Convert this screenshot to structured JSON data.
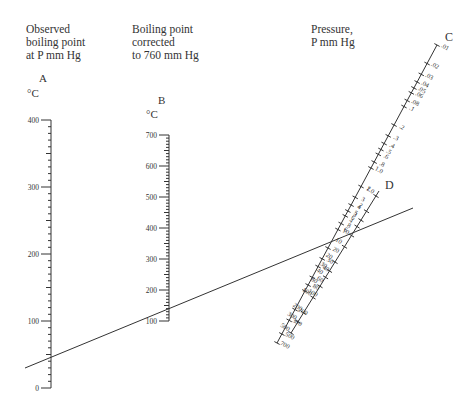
{
  "headers": {
    "observed": [
      "Observed",
      "boiling point",
      "at P mm Hg"
    ],
    "corrected": [
      "Boiling point",
      "corrected",
      "to 760 mm Hg"
    ],
    "pressure": [
      "Pressure,",
      "P mm Hg"
    ]
  },
  "scales": {
    "A": {
      "letter": "A",
      "unit": "°C",
      "ticks": [
        "400",
        "300",
        "200",
        "100",
        "0"
      ]
    },
    "B": {
      "letter": "B",
      "unit": "°C",
      "ticks": [
        "700",
        "600",
        "500",
        "400",
        "300",
        "200",
        "100"
      ]
    },
    "C": {
      "letter": "C",
      "ticks": [
        ".01",
        ".02",
        ".03",
        ".04",
        ".05",
        ".06",
        ".08",
        ".1",
        ".2",
        ".3",
        ".4",
        ".5",
        ".6",
        ".8",
        "1.0",
        "2",
        "3",
        "4",
        "5",
        "6",
        "8",
        "10",
        "20",
        "30",
        "40",
        "60",
        "80",
        "100",
        "200",
        "300",
        "500",
        "700"
      ]
    },
    "D": {
      "letter": "D",
      "ticks": [
        "1.0",
        "2",
        "3",
        "4",
        "6",
        "10",
        "20",
        "30",
        "40",
        "60",
        "100",
        "200",
        "300",
        "500"
      ]
    }
  },
  "colors": {
    "ink": "#333333",
    "background": "#ffffff"
  },
  "chart_data": {
    "type": "nomograph",
    "axes": [
      {
        "id": "A",
        "label": "Observed boiling point at P mm Hg",
        "unit": "°C",
        "range": [
          0,
          400
        ],
        "major_ticks": [
          0,
          100,
          200,
          300,
          400
        ]
      },
      {
        "id": "B",
        "label": "Boiling point corrected to 760 mm Hg",
        "unit": "°C",
        "range": [
          100,
          700
        ],
        "major_ticks": [
          100,
          200,
          300,
          400,
          500,
          600,
          700
        ]
      },
      {
        "id": "C",
        "label": "Pressure, P mm Hg",
        "unit": "mm Hg",
        "range": [
          0.01,
          700
        ],
        "scale": "log"
      },
      {
        "id": "D",
        "label": "Pressure, P mm Hg",
        "unit": "mm Hg",
        "range": [
          1.0,
          500
        ],
        "scale": "log"
      }
    ],
    "example_line": {
      "A_value": 50,
      "B_value": 145,
      "D_value": 10
    }
  }
}
